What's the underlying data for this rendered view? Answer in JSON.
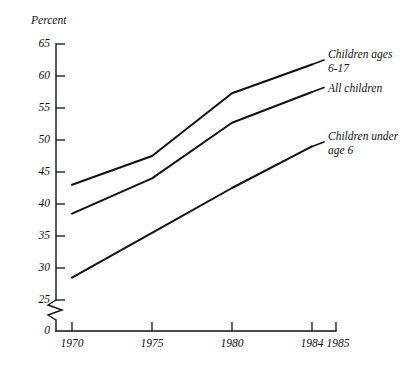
{
  "chart_data": {
    "type": "line",
    "title": "",
    "xlabel": "",
    "ylabel": "Percent",
    "x": [
      1970,
      1975,
      1980,
      1984
    ],
    "xtick_labels": [
      "1970",
      "1975",
      "1980",
      "1984",
      "1985"
    ],
    "xtick_values": [
      1970,
      1975,
      1980,
      1984,
      1985
    ],
    "ytick_labels": [
      "0",
      "25",
      "30",
      "35",
      "40",
      "45",
      "50",
      "55",
      "60",
      "65"
    ],
    "ytick_values": [
      0,
      25,
      30,
      35,
      40,
      45,
      50,
      55,
      60,
      65
    ],
    "ylim": [
      25,
      65
    ],
    "xlim": [
      1970,
      1985
    ],
    "axis_break": true,
    "grid": false,
    "legend_position": "inline-right",
    "series": [
      {
        "name": "Children ages 6-17",
        "label_text": "Children ages\n6-17",
        "values": [
          43.0,
          47.5,
          57.3,
          61.8
        ]
      },
      {
        "name": "All children",
        "label_text": "All children",
        "values": [
          38.5,
          44.0,
          52.7,
          57.5
        ]
      },
      {
        "name": "Children under age 6",
        "label_text": "Children under\nage 6",
        "values": [
          28.5,
          35.5,
          42.5,
          49.0
        ]
      }
    ]
  },
  "labels": {
    "y_axis_title": "Percent",
    "y_ticks": [
      "65",
      "60",
      "55",
      "50",
      "45",
      "40",
      "35",
      "30",
      "25",
      "0"
    ],
    "x_ticks": [
      "1970",
      "1975",
      "1980",
      "1984",
      "1985"
    ],
    "series_0": "Children ages\n6-17",
    "series_1": "All children",
    "series_2": "Children under\nage 6"
  }
}
